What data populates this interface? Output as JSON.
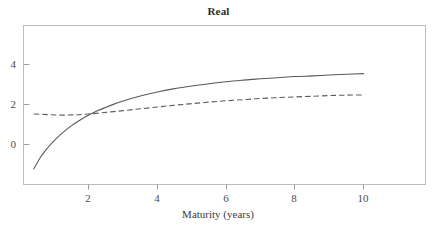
{
  "chart_data": {
    "type": "line",
    "title": "Real",
    "xlabel": "Maturity (years)",
    "ylabel": "",
    "xlim": [
      0.1,
      11.8
    ],
    "ylim": [
      -1.85,
      5.25
    ],
    "xticks": [
      2,
      4,
      6,
      8,
      10
    ],
    "xtick_labels": [
      "2",
      "4",
      "6",
      "8",
      "10"
    ],
    "yticks": [
      0,
      2,
      4
    ],
    "ytick_labels": [
      "0",
      "2",
      "4"
    ],
    "grid": false,
    "legend": "none",
    "frame": "box",
    "series": [
      {
        "name": "solid-curve",
        "style": "solid",
        "color": "#595959",
        "x": [
          0.4,
          0.6,
          0.8,
          1.0,
          1.25,
          1.5,
          1.75,
          2.0,
          2.25,
          2.5,
          2.75,
          3.0,
          3.5,
          4.0,
          4.5,
          5.0,
          5.5,
          6.0,
          6.5,
          7.0,
          7.5,
          8.0,
          8.5,
          9.0,
          9.5,
          10.0
        ],
        "y": [
          -1.15,
          -0.62,
          -0.22,
          0.12,
          0.48,
          0.78,
          1.03,
          1.25,
          1.44,
          1.6,
          1.75,
          1.88,
          2.1,
          2.28,
          2.43,
          2.55,
          2.65,
          2.74,
          2.81,
          2.87,
          2.92,
          2.97,
          3.0,
          3.04,
          3.07,
          3.1
        ]
      },
      {
        "name": "dashed-curve",
        "style": "dashed",
        "color": "#5e5e5e",
        "x": [
          0.4,
          0.8,
          1.2,
          1.6,
          2.0,
          2.5,
          3.0,
          3.5,
          4.0,
          4.5,
          5.0,
          5.5,
          6.0,
          6.5,
          7.0,
          7.5,
          8.0,
          8.5,
          9.0,
          9.5,
          10.0
        ],
        "y": [
          1.3,
          1.27,
          1.25,
          1.26,
          1.3,
          1.37,
          1.45,
          1.53,
          1.61,
          1.69,
          1.76,
          1.83,
          1.89,
          1.94,
          1.99,
          2.03,
          2.06,
          2.09,
          2.12,
          2.14,
          2.15
        ]
      }
    ],
    "annotations": {
      "crossover_x": 1.5,
      "crossover_y": 1.26
    }
  },
  "axes": {
    "frame_color": "#b9b9b9",
    "tick_color": "#9a9a9a"
  }
}
